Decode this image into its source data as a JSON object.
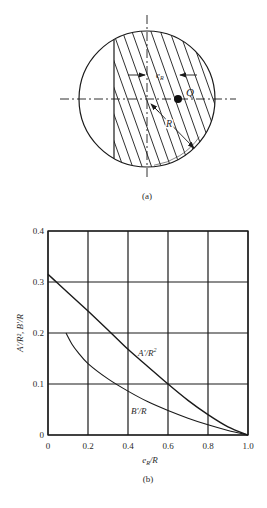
{
  "figure_a": {
    "caption": "(a)",
    "labels": {
      "eccentricity": "e",
      "eccentricity_sub": "R",
      "point": "Q",
      "radius": "R"
    },
    "geometry": {
      "center": [
        147,
        99
      ],
      "radius": 68,
      "chord_x": 114,
      "q_point": [
        178,
        99
      ]
    }
  },
  "figure_b": {
    "caption": "(b)"
  },
  "chart_data": {
    "type": "line",
    "title": "",
    "xlabel": "e_R/R",
    "ylabel": "A'/R², B'/R",
    "xlim": [
      0,
      1.0
    ],
    "ylim": [
      0,
      0.4
    ],
    "grid": true,
    "x_ticks": [
      "0",
      "0.2",
      "0.4",
      "0.6",
      "0.8",
      "1.0"
    ],
    "y_ticks": [
      "0",
      "0.1",
      "0.2",
      "0.3",
      "0.4"
    ],
    "series": [
      {
        "name": "A'/R²",
        "label": "A'/R",
        "label_sup": "2",
        "x": [
          0,
          0.05,
          0.1,
          0.2,
          0.3,
          0.4,
          0.5,
          0.6,
          0.7,
          0.8,
          0.9,
          1.0
        ],
        "values": [
          0.315,
          0.297,
          0.279,
          0.243,
          0.206,
          0.168,
          0.134,
          0.1,
          0.068,
          0.04,
          0.016,
          0.0
        ]
      },
      {
        "name": "B'/R",
        "label": "B'/R",
        "x": [
          0.09,
          0.12,
          0.15,
          0.2,
          0.3,
          0.4,
          0.5,
          0.6,
          0.7,
          0.8,
          0.9,
          1.0
        ],
        "values": [
          0.2,
          0.178,
          0.162,
          0.14,
          0.11,
          0.086,
          0.065,
          0.048,
          0.033,
          0.02,
          0.009,
          0.0
        ]
      }
    ]
  }
}
